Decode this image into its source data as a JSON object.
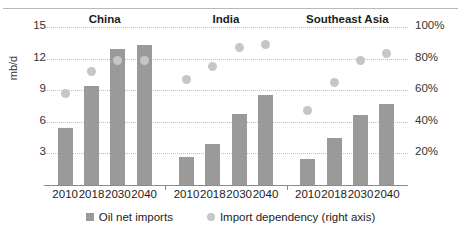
{
  "chart_data": {
    "type": "bar",
    "title": "",
    "subtitle": "",
    "ylabel": "mb/d",
    "xlabel": "",
    "ylim": [
      0,
      15
    ],
    "y_ticks": [
      "3",
      "6",
      "9",
      "12",
      "15"
    ],
    "y2label": "",
    "y2lim": [
      0,
      100
    ],
    "y2_ticks": [
      "20%",
      "40%",
      "60%",
      "80%",
      "100%"
    ],
    "grid": true,
    "legend_position": "bottom",
    "categories": [
      "2010",
      "2018",
      "2030",
      "2040"
    ],
    "panels": [
      {
        "name": "China",
        "bars": [
          5.4,
          9.4,
          12.9,
          13.3
        ],
        "dots": [
          58,
          72,
          79,
          79
        ]
      },
      {
        "name": "India",
        "bars": [
          2.7,
          3.9,
          6.7,
          8.5
        ],
        "dots": [
          67,
          75,
          87,
          89
        ]
      },
      {
        "name": "Southeast Asia",
        "bars": [
          2.5,
          4.5,
          6.6,
          7.7
        ],
        "dots": [
          47,
          65,
          79,
          83
        ]
      }
    ],
    "series": [
      {
        "name": "Oil net imports",
        "axis": "left",
        "marker": "square",
        "color": "#9a9a9a"
      },
      {
        "name": "Import dependency (right axis)",
        "axis": "right",
        "marker": "circle",
        "color": "#c6c6c6"
      }
    ]
  },
  "legend": {
    "bars_label": "Oil net imports",
    "dots_label": "Import dependency (right axis)"
  },
  "colors": {
    "bar": "#9a9a9a",
    "dot": "#c6c6c6",
    "grid": "#bfbfbf",
    "axis": "#8c8c8c"
  }
}
